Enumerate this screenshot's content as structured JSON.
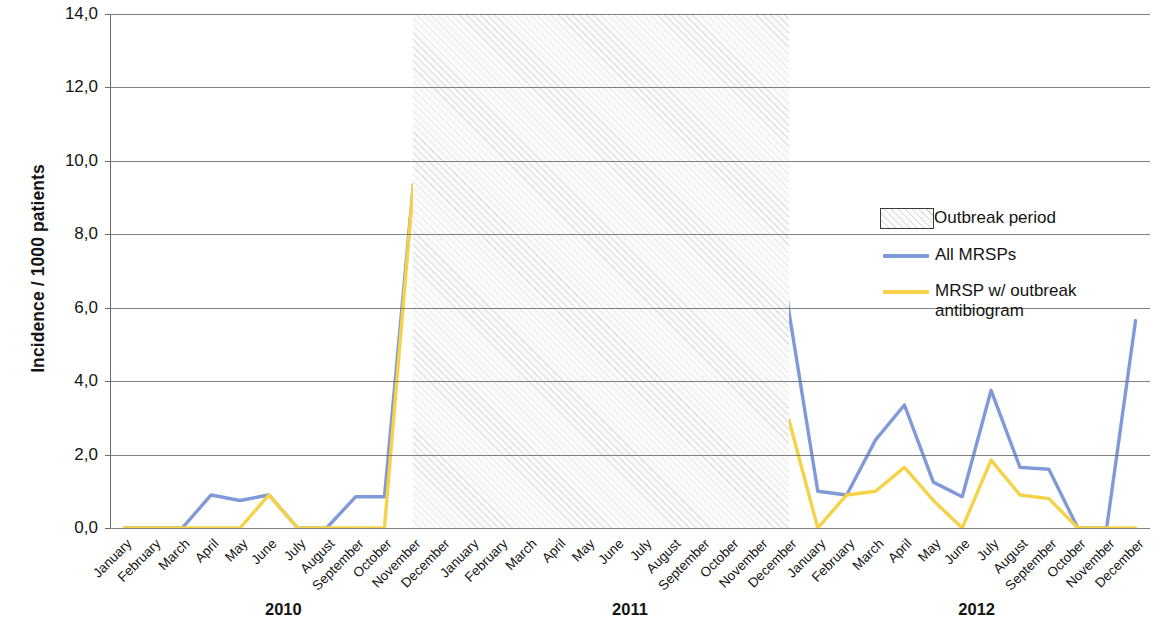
{
  "chart_data": {
    "type": "line",
    "title": "",
    "xlabel": "",
    "ylabel": "Incidence / 1000 patients",
    "ylim": [
      0,
      14
    ],
    "ytick_labels": [
      "0,0",
      "2,0",
      "4,0",
      "6,0",
      "8,0",
      "10,0",
      "12,0",
      "14,0"
    ],
    "ytick_values": [
      0,
      2,
      4,
      6,
      8,
      10,
      12,
      14
    ],
    "grid": true,
    "legend_position": "right",
    "categories": [
      "January",
      "February",
      "March",
      "April",
      "May",
      "June",
      "July",
      "August",
      "September",
      "October",
      "November",
      "December",
      "January",
      "February",
      "March",
      "April",
      "May",
      "June",
      "July",
      "August",
      "September",
      "October",
      "November",
      "December",
      "January",
      "February",
      "March",
      "April",
      "May",
      "June",
      "July",
      "August",
      "September",
      "October",
      "November",
      "December"
    ],
    "year_groups": [
      {
        "label": "2010",
        "start_index": 0,
        "end_index": 11
      },
      {
        "label": "2011",
        "start_index": 12,
        "end_index": 23
      },
      {
        "label": "2012",
        "start_index": 24,
        "end_index": 35
      }
    ],
    "series": [
      {
        "name": "All MRSPs",
        "color": "#8099d9",
        "values": [
          0.0,
          0.0,
          0.0,
          0.9,
          0.75,
          0.9,
          0.0,
          0.0,
          0.85,
          0.85,
          9.35,
          1.75,
          4.4,
          2.9,
          2.55,
          0.0,
          2.0,
          4.1,
          3.85,
          4.2,
          6.2,
          11.3,
          12.2,
          5.9,
          1.0,
          0.9,
          2.4,
          3.35,
          1.25,
          0.85,
          3.75,
          1.65,
          1.6,
          0.0,
          0.0,
          5.65
        ]
      },
      {
        "name": "MRSP w/ outbreak antibiogram",
        "color": "#f5d247",
        "values": [
          0.0,
          0.0,
          0.0,
          0.0,
          0.0,
          0.9,
          0.0,
          0.0,
          0.0,
          0.0,
          9.35,
          1.75,
          4.4,
          2.9,
          2.55,
          0.0,
          2.0,
          3.5,
          3.9,
          3.45,
          5.2,
          9.65,
          3.25,
          2.95,
          0.0,
          0.9,
          1.0,
          1.65,
          0.75,
          0.0,
          1.85,
          0.9,
          0.8,
          0.0,
          0.0,
          0.0
        ]
      }
    ],
    "annotations": [
      {
        "name": "Outbreak period",
        "type": "shaded-band",
        "start_index": 10,
        "end_index": 23
      }
    ]
  },
  "legend": {
    "items": [
      {
        "label": "Outbreak period",
        "marker": "hatched-box"
      },
      {
        "label": "All MRSPs",
        "marker": "line",
        "color": "#8099d9"
      },
      {
        "label": "MRSP w/ outbreak\nantibiogram",
        "marker": "line",
        "color": "#f5d247"
      }
    ],
    "outbreak_label": "Outbreak period",
    "all_mrsps_label": "All MRSPs",
    "antibiogram_label_line1": "MRSP w/ outbreak",
    "antibiogram_label_line2": "antibiogram"
  }
}
